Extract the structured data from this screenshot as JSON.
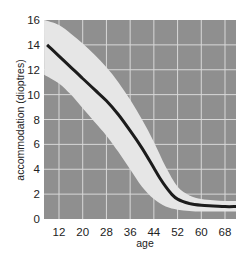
{
  "chart_data": {
    "type": "line",
    "title": "",
    "xlabel": "age",
    "ylabel": "accommodation (dioptres)",
    "xlim": [
      7,
      72
    ],
    "ylim": [
      0,
      16
    ],
    "grid": true,
    "x_ticks": [
      12,
      20,
      28,
      36,
      44,
      52,
      60,
      68
    ],
    "y_ticks": [
      0,
      2,
      4,
      6,
      8,
      10,
      12,
      14,
      16
    ],
    "series": [
      {
        "name": "mean accommodation",
        "x": [
          8,
          12,
          16,
          20,
          24,
          28,
          32,
          36,
          40,
          44,
          46,
          48,
          50,
          52,
          56,
          60,
          64,
          68,
          72
        ],
        "values": [
          14.0,
          13.1,
          12.2,
          11.3,
          10.4,
          9.5,
          8.4,
          7.1,
          5.7,
          4.1,
          3.3,
          2.6,
          2.0,
          1.6,
          1.25,
          1.1,
          1.05,
          1.0,
          1.0
        ]
      },
      {
        "name": "upper range",
        "x": [
          7,
          12,
          16,
          20,
          24,
          28,
          32,
          36,
          40,
          44,
          48,
          52,
          56,
          60,
          64,
          68,
          72
        ],
        "values": [
          16.0,
          15.6,
          14.9,
          14.1,
          13.2,
          12.2,
          11.0,
          9.6,
          8.0,
          6.2,
          4.2,
          2.6,
          1.9,
          1.6,
          1.5,
          1.45,
          1.45
        ]
      },
      {
        "name": "lower range",
        "x": [
          7,
          12,
          16,
          20,
          24,
          28,
          32,
          36,
          40,
          44,
          48,
          52,
          56,
          60,
          64,
          68,
          72
        ],
        "values": [
          11.6,
          10.9,
          10.0,
          8.9,
          7.8,
          6.7,
          5.4,
          4.0,
          2.6,
          1.6,
          1.0,
          0.75,
          0.65,
          0.6,
          0.6,
          0.6,
          0.6
        ]
      }
    ],
    "colors": {
      "plot_background": "#8f8f8f",
      "grid": "#d8d8d8",
      "band": "#e6e6e6",
      "line": "#1c1c1c"
    },
    "annotations": []
  }
}
